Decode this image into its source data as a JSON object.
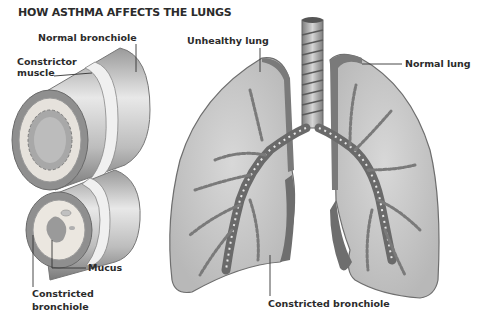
{
  "title": "HOW ASTHMA AFFECTS THE LUNGS",
  "labels": {
    "normal_bronchiole": "Normal bronchiole",
    "constrictor_muscle_line1": "Constrictor",
    "constrictor_muscle_line2": "muscle",
    "mucus": "Mucus",
    "constricted_bronchiole_line1": "Constricted",
    "constricted_bronchiole_line2": "bronchiole",
    "unhealthy_lung": "Unhealthy lung",
    "normal_lung": "Normal lung",
    "constricted_bronchiole_lung": "Constricted bronchiole"
  },
  "colors": {
    "text": "#2b2b2b",
    "lung_fill": "#c9c9c9",
    "lung_edge": "#6e6e6e",
    "tube_light": "#e6e6e6",
    "tube_dark": "#8a8a8a"
  }
}
